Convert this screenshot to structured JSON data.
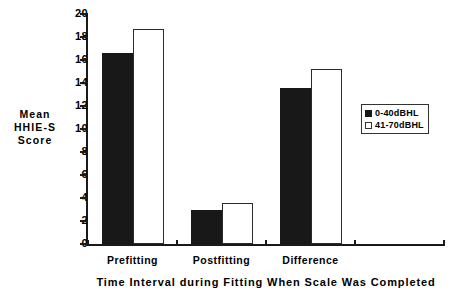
{
  "chart_data": {
    "type": "bar",
    "title": "",
    "categories": [
      "Prefitting",
      "Postfitting",
      "Difference"
    ],
    "series": [
      {
        "name": "0-40dBHL",
        "values": [
          16.65,
          2.95,
          13.55
        ],
        "color": "#181818"
      },
      {
        "name": "41-70dBHL",
        "values": [
          18.7,
          3.6,
          15.2
        ],
        "color": "#ffffff"
      }
    ],
    "xlabel": "Time Interval during Fitting When Scale Was Completed",
    "ylabel": "Mean HHIE-S Score",
    "ylim": [
      0,
      20
    ],
    "ytick_step": 2,
    "yticks": [
      0,
      2,
      4,
      6,
      8,
      10,
      12,
      14,
      16,
      18,
      20
    ],
    "grid": false,
    "legend_position": "right"
  },
  "axes": {
    "y_title_lines": [
      "Mean",
      "HHIE-S",
      "Score"
    ],
    "y_tick_labels": [
      "20",
      "18",
      "16",
      "14",
      "12",
      "10",
      "8",
      "6",
      "4",
      "2",
      "0"
    ],
    "x_title": "Time Interval during Fitting When Scale Was Completed",
    "x_category_labels": [
      "Prefitting",
      "Postfitting",
      "Difference"
    ]
  },
  "legend": {
    "items": [
      {
        "label": "0-40dBHL",
        "style": "filled"
      },
      {
        "label": "41-70dBHL",
        "style": "outline"
      }
    ]
  }
}
